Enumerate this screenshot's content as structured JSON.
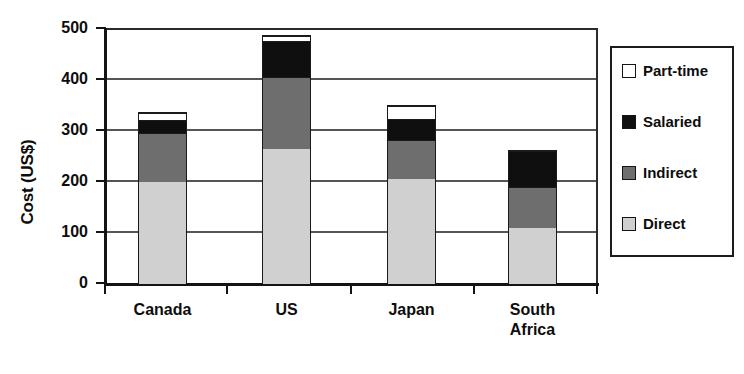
{
  "chart_data": {
    "type": "bar",
    "subtype": "stacked-bar",
    "title": "",
    "xlabel": "",
    "ylabel": "Cost (US$)",
    "ylim": [
      0,
      500
    ],
    "yticks": [
      0,
      100,
      200,
      300,
      400,
      500
    ],
    "ytick_labels": [
      "0",
      "100",
      "200",
      "300",
      "400",
      "500"
    ],
    "grid": "horizontal",
    "legend_position": "right-outside",
    "categories": [
      "Canada",
      "US",
      "Japan",
      "South Africa"
    ],
    "category_label_lines": [
      [
        "Canada"
      ],
      [
        "US"
      ],
      [
        "Japan"
      ],
      [
        "South",
        "Africa"
      ]
    ],
    "series": [
      {
        "name": "Direct",
        "color": "#d0d0d0",
        "values": [
          200,
          265,
          206,
          110
        ]
      },
      {
        "name": "Indirect",
        "color": "#6e6e6e",
        "values": [
          96,
          141,
          76,
          80
        ]
      },
      {
        "name": "Salaried",
        "color": "#0f0f0f",
        "values": [
          26,
          70,
          42,
          71
        ]
      },
      {
        "name": "Part-time",
        "color": "#ffffff",
        "values": [
          13,
          10,
          25,
          0
        ]
      }
    ],
    "stack_order_bottom_to_top": [
      "Direct",
      "Indirect",
      "Salaried",
      "Part-time"
    ],
    "totals": [
      335,
      486,
      349,
      261
    ],
    "legend_entries": [
      {
        "label": "Part-time",
        "color": "#ffffff"
      },
      {
        "label": "Salaried",
        "color": "#0f0f0f"
      },
      {
        "label": "Indirect",
        "color": "#6e6e6e"
      },
      {
        "label": "Direct",
        "color": "#d0d0d0"
      }
    ]
  }
}
